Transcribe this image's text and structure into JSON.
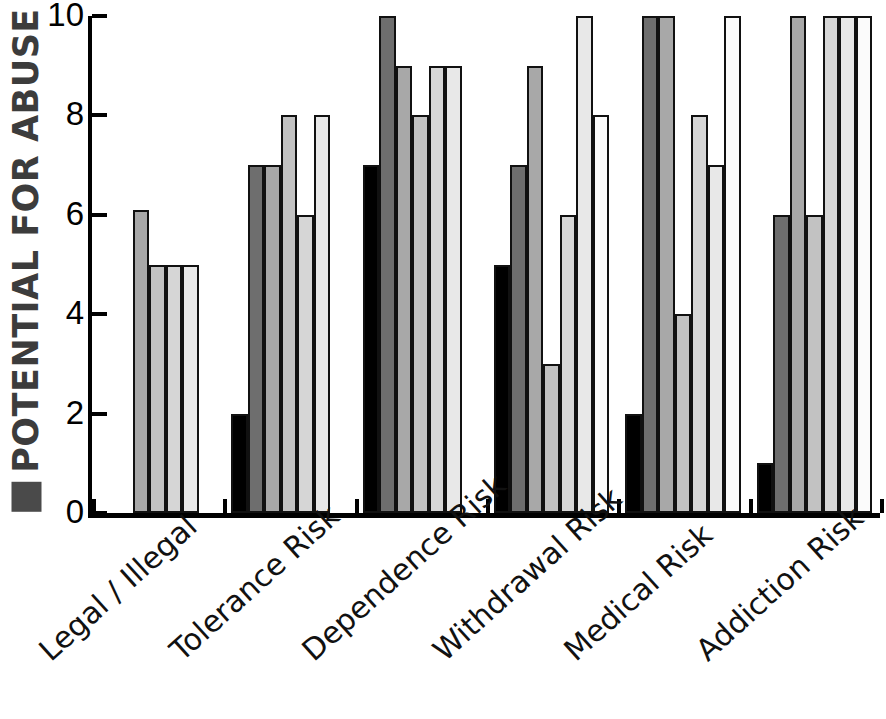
{
  "chart_data": {
    "type": "bar",
    "title": "",
    "ylabel": "POTENTIAL FOR ABUSE",
    "xlabel": "",
    "ylim": [
      0,
      10
    ],
    "yticks": [
      0,
      2,
      4,
      6,
      8,
      10
    ],
    "grid": false,
    "legend": "none",
    "orientation": "vertical",
    "grouping": "clustered",
    "categories": [
      "Legal / Illegal",
      "Tolerance Risk",
      "Dependence Risk",
      "Withdrawal Risk",
      "Medical Risk",
      "Addiction Risk"
    ],
    "series": [
      {
        "name": "series-1",
        "color": "#000000",
        "values": [
          0,
          2,
          7,
          5,
          2,
          1
        ]
      },
      {
        "name": "series-2",
        "color": "#6e6e6e",
        "values": [
          0,
          7,
          10,
          7,
          10,
          6
        ]
      },
      {
        "name": "series-3",
        "color": "#a8a8a8",
        "values": [
          6.1,
          7,
          9,
          9,
          10,
          10
        ]
      },
      {
        "name": "series-4",
        "color": "#c2c2c2",
        "values": [
          5,
          8,
          8,
          3,
          4,
          6
        ]
      },
      {
        "name": "series-5",
        "color": "#d6d6d6",
        "values": [
          5,
          6,
          9,
          6,
          8,
          10
        ]
      },
      {
        "name": "series-6",
        "color": "#e8e8e8",
        "values": [
          5,
          8,
          9,
          10,
          7,
          10
        ]
      },
      {
        "name": "series-7",
        "color": "#fbfbfb",
        "values": [
          0,
          0,
          0,
          8,
          10,
          10
        ]
      }
    ]
  },
  "axis": {
    "y_tick_labels": [
      "10",
      "8",
      "6",
      "4",
      "2",
      "0"
    ],
    "y_title_text": "POTENTIAL FOR ABUSE",
    "y_title_swatch_color": "#4a4a4a"
  },
  "x_labels": [
    "Legal / Illegal",
    "Tolerance Risk",
    "Dependence Risk",
    "Withdrawal Risk",
    "Medical Risk",
    "Addiction Risk"
  ]
}
